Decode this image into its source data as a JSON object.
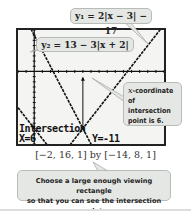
{
  "equations": {
    "y1": "y₁ = 2|x − 3| − 17",
    "y2": "y₂ = 13 − 3|x + 2|"
  },
  "calculator": {
    "label": "Intersection",
    "x_readout": "X=6",
    "y_readout": "Y=-11"
  },
  "annotation": {
    "x_var": "x",
    "text_line1": "-coordinate",
    "text_line2": "of intersection",
    "text_line3": "point is 6."
  },
  "window_caption": "[−2, 16, 1] by [−14, 8, 1]",
  "tip": {
    "line1": "Choose a large enough viewing rectangle",
    "line2": "so that you can see the intersection point."
  },
  "colors": {
    "screen_bg": "#f4f4f2",
    "callout_bg": "#e4e7e4",
    "graph_line": "#111111"
  },
  "chart_data": {
    "type": "line",
    "title": "",
    "xlabel": "",
    "ylabel": "",
    "xlim": [
      -2,
      16
    ],
    "ylim": [
      -14,
      8
    ],
    "xscl": 1,
    "yscl": 1,
    "grid": false,
    "series": [
      {
        "name": "y1 = 2|x-3|-17",
        "x": [
          -2,
          3,
          16
        ],
        "values": [
          -7,
          -17,
          9
        ]
      },
      {
        "name": "y2 = 13-3|x+2|",
        "x": [
          -2,
          16
        ],
        "values": [
          13,
          -41
        ]
      }
    ],
    "annotations": [
      {
        "type": "intersection",
        "x": 6,
        "y": -11
      }
    ]
  }
}
